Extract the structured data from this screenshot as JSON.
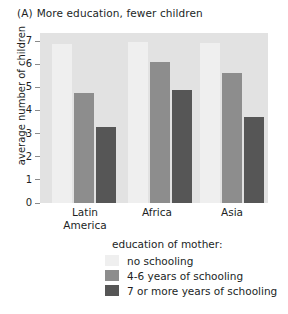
{
  "chart_data": {
    "type": "bar",
    "title_tag": "(A)",
    "title_text": "More education, fewer children",
    "xlabel": "",
    "ylabel": "average number of children",
    "ylim": [
      0,
      7
    ],
    "yticks": [
      7,
      6,
      5,
      4,
      3,
      2,
      1,
      0
    ],
    "grid": false,
    "legend_position": "bottom",
    "legend_title": "education of mother:",
    "categories": [
      "Latin America",
      "Africa",
      "Asia"
    ],
    "category_lines": [
      [
        "Latin",
        "America"
      ],
      [
        "Africa"
      ],
      [
        "Asia"
      ]
    ],
    "series": [
      {
        "name": "no schooling",
        "color": "#efefef",
        "values": [
          6.85,
          6.95,
          6.9
        ]
      },
      {
        "name": "4-6 years of schooling",
        "color": "#8d8d8d",
        "values": [
          4.75,
          6.1,
          5.6
        ]
      },
      {
        "name": "7 or more years of schooling",
        "color": "#565656",
        "values": [
          3.3,
          4.9,
          3.7
        ]
      }
    ],
    "colors": {
      "plot_background": "#e2e2e2",
      "page_background": "#ffffff",
      "text": "#221f1f",
      "axis": "#8a8a8a"
    }
  }
}
